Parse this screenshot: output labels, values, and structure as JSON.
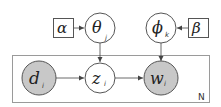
{
  "diagram": {
    "type": "plate-notation-graphical-model",
    "nodes": [
      {
        "id": "alpha",
        "label": "α",
        "subscript": "",
        "shape": "square",
        "observed": false
      },
      {
        "id": "theta",
        "label": "θ",
        "subscript": "j",
        "shape": "circle",
        "observed": false
      },
      {
        "id": "phi",
        "label": "ϕ",
        "subscript": "k",
        "shape": "circle",
        "observed": false
      },
      {
        "id": "beta",
        "label": "β",
        "subscript": "",
        "shape": "square",
        "observed": false
      },
      {
        "id": "d",
        "label": "d",
        "subscript": "i",
        "shape": "circle",
        "observed": true
      },
      {
        "id": "z",
        "label": "z",
        "subscript": "i",
        "shape": "circle",
        "observed": false
      },
      {
        "id": "w",
        "label": "w",
        "subscript": "i",
        "shape": "circle",
        "observed": true
      }
    ],
    "edges": [
      {
        "from": "alpha",
        "to": "theta"
      },
      {
        "from": "beta",
        "to": "phi"
      },
      {
        "from": "theta",
        "to": "z"
      },
      {
        "from": "phi",
        "to": "w"
      },
      {
        "from": "d",
        "to": "z"
      },
      {
        "from": "z",
        "to": "w"
      }
    ],
    "plate": {
      "label": "N",
      "contains": [
        "d",
        "z",
        "w"
      ]
    },
    "colors": {
      "observed_fill": "#c8c8c8",
      "stroke": "#555555",
      "plate_stroke": "#9a9a9a"
    }
  }
}
